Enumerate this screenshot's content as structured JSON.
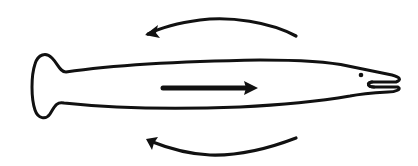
{
  "diagram": {
    "colors": {
      "background": "#ffffff",
      "stroke": "#111111"
    },
    "body_outline_path": "M66,72 C120,64 200,61 260,60 C300,60 330,62 348,66 C362,69 378,72 392,75 C400,77 402,80 396,82 L372,82 C366,83 368,87 374,87 L398,87 C402,89 396,92 388,92 C372,93 360,94 350,96 C320,101 280,105 240,107 C190,109 120,109 64,103 C56,101 54,108 50,114 C46,120 38,119 35,110 C31,98 31,76 35,64 C38,54 46,52 52,58 C58,64 60,72 66,72 Z",
    "eye": {
      "cx": 361,
      "cy": 75,
      "r": 2.3
    },
    "mouth_path": "M372,82 C366,83 368,87 374,87",
    "top_flow_arrow": {
      "path": "M296,36 C270,22 230,16 200,20 C178,23 160,28 148,34",
      "head": "M145,35 L158,25 L156,33 L160,38 Z"
    },
    "bottom_flow_arrow": {
      "path": "M296,138 C270,148 240,156 210,155 C185,154 165,147 150,141",
      "head": "M146,139 L158,137 L154,143 L152,150 Z"
    },
    "center_arrow": {
      "x1": 163,
      "y1": 88,
      "x2": 248,
      "y2": 88,
      "head": "M258,88 L244,81 L246,88 L244,95 Z"
    }
  }
}
